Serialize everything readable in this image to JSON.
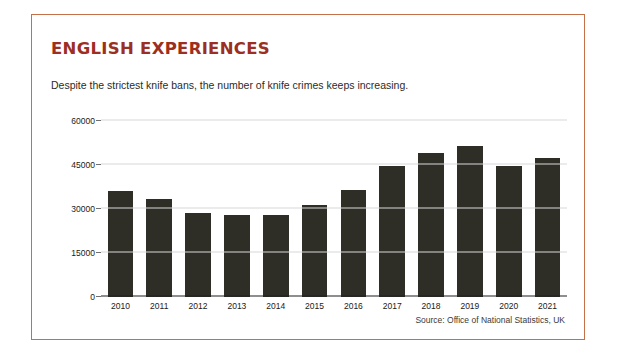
{
  "card": {
    "border_color": "#c4714a",
    "title": "ENGLISH EXPERIENCES",
    "title_color": "#9c2e22",
    "subtitle": "Despite the strictest knife bans, the number of knife crimes keeps increasing.",
    "source": "Source: Office of National Statistics, UK"
  },
  "chart_data": {
    "type": "bar",
    "title": "ENGLISH EXPERIENCES",
    "subtitle": "Despite the strictest knife bans, the number of knife crimes keeps increasing.",
    "xlabel": "",
    "ylabel": "",
    "ylim": [
      0,
      60000
    ],
    "yticks": [
      0,
      15000,
      30000,
      45000,
      60000
    ],
    "ytick_labels": [
      "0",
      "15000",
      "30000",
      "45000",
      "60000"
    ],
    "grid": true,
    "legend": null,
    "bar_color": "#2f2e26",
    "categories": [
      "2010",
      "2011",
      "2012",
      "2013",
      "2014",
      "2015",
      "2016",
      "2017",
      "2018",
      "2019",
      "2020",
      "2021"
    ],
    "values": [
      36000,
      33500,
      28500,
      28000,
      28000,
      31500,
      36500,
      44500,
      49000,
      51500,
      44500,
      47500
    ],
    "source": "Source: Office of National Statistics, UK"
  }
}
